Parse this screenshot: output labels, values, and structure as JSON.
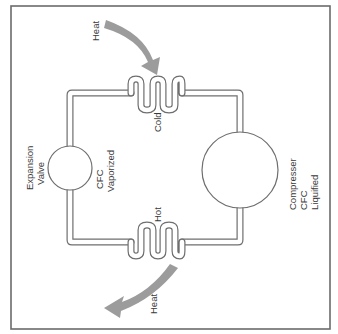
{
  "diagram": {
    "frame_color": "#6b6b6b",
    "pipe_color": "#6e6e6e",
    "arrow_color": "#9c9c9c",
    "labels": {
      "heat_in": "Heat",
      "heat_out": "Heat",
      "cold": "Cold",
      "hot": "Hot",
      "expansion_valve_line1": "Expansion",
      "expansion_valve_line2": "Valve",
      "cfc_vaporized_line1": "CFC",
      "cfc_vaporized_line2": "Vaporized",
      "compressor_line1": "Compresser",
      "compressor_line2": "CFC",
      "compressor_line3": "Liquified"
    },
    "components": [
      {
        "name": "Expansion Valve",
        "state": "CFC Vaporized"
      },
      {
        "name": "Cold coil",
        "heat_flow": "in"
      },
      {
        "name": "Compresser",
        "state": "CFC Liquified"
      },
      {
        "name": "Hot coil",
        "heat_flow": "out"
      }
    ]
  }
}
